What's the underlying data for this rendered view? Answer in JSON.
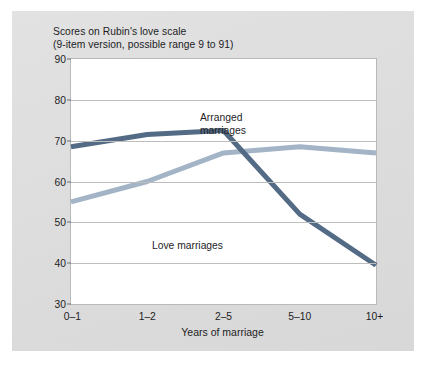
{
  "figure": {
    "background": "#ffffff",
    "panel_color": "#dfdfdf"
  },
  "title": {
    "line1": "Scores on Rubin's love scale",
    "line2": "(9-item version, possible range 9 to 91)"
  },
  "annotations": {
    "arranged": "Arranged\nmarriages",
    "love": "Love marriages"
  },
  "axis": {
    "x_title": "Years of marriage",
    "y_ticks": [
      "90",
      "80",
      "70",
      "60",
      "50",
      "40",
      "30"
    ],
    "x_ticks": [
      "0–1",
      "1–2",
      "2–5",
      "5–10",
      "10+"
    ]
  },
  "chart_data": {
    "type": "line",
    "title": "Scores on Rubin's love scale (9-item version, possible range 9 to 91)",
    "xlabel": "Years of marriage",
    "ylabel": "Scores on Rubin's love scale",
    "categories": [
      "0–1",
      "1–2",
      "2–5",
      "5–10",
      "10+"
    ],
    "ylim": [
      30,
      90
    ],
    "ytick_values": [
      30,
      40,
      50,
      60,
      70,
      80,
      90
    ],
    "grid": "horizontal",
    "legend": "inline-annotations",
    "series": [
      {
        "name": "Arranged marriages",
        "color": "#a3b4c6",
        "values": [
          55,
          60,
          67,
          68.5,
          67
        ]
      },
      {
        "name": "Love marriages",
        "color": "#546b85",
        "values": [
          68.5,
          71.5,
          72.5,
          52,
          39.5
        ]
      }
    ]
  }
}
